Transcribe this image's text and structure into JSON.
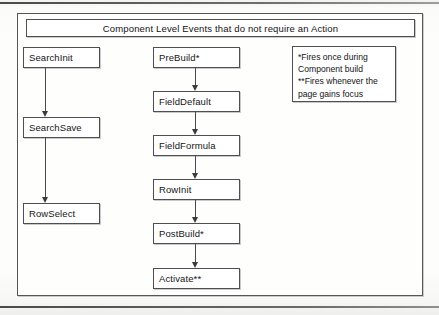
{
  "document": {
    "title_banner": "Component Level Events that do not require an Action"
  },
  "legend": {
    "lines": [
      "*Fires once during",
      "Component build",
      "**Fires whenever the",
      "page gains focus"
    ]
  },
  "flow": {
    "left_column": [
      {
        "id": "searchinit",
        "label": "SearchInit"
      },
      {
        "id": "searchsave",
        "label": "SearchSave"
      },
      {
        "id": "rowselect",
        "label": "RowSelect"
      }
    ],
    "center_column": [
      {
        "id": "prebuild",
        "label": "PreBuild*"
      },
      {
        "id": "fielddefault",
        "label": "FieldDefault"
      },
      {
        "id": "fieldformula",
        "label": "FieldFormula"
      },
      {
        "id": "rowinit",
        "label": "RowInit"
      },
      {
        "id": "postbuild",
        "label": "PostBuild*"
      },
      {
        "id": "activate",
        "label": "Activate**"
      }
    ]
  },
  "colors": {
    "border": "#4f4f53",
    "text": "#141414",
    "paper": "#fdfdfc",
    "arrow": "#3b3b3f"
  }
}
